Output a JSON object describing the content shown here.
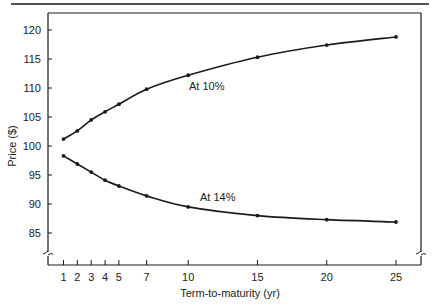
{
  "chart_data": {
    "type": "line",
    "title": "",
    "xlabel": "Term-to-maturity (yr)",
    "ylabel": "Price ($)",
    "x": [
      1,
      2,
      3,
      4,
      5,
      7,
      10,
      15,
      20,
      25
    ],
    "x_ticks": [
      1,
      2,
      3,
      4,
      5,
      7,
      10,
      15,
      20,
      25
    ],
    "y_ticks": [
      85,
      90,
      95,
      100,
      105,
      110,
      115,
      120
    ],
    "xlim": [
      0,
      27
    ],
    "ylim": [
      81.5,
      121.5
    ],
    "y_axis_break": true,
    "grid": false,
    "legend": "none",
    "series": [
      {
        "name": "At 10%",
        "values": [
          101.2,
          102.6,
          104.5,
          105.9,
          107.2,
          109.8,
          112.2,
          115.3,
          117.4,
          118.8
        ]
      },
      {
        "name": "At 14%",
        "values": [
          98.3,
          96.9,
          95.5,
          94.1,
          93.1,
          91.4,
          89.5,
          88.0,
          87.3,
          86.9
        ]
      }
    ],
    "annotations": [
      {
        "text": "At 10%",
        "series": "At 10%",
        "near_x": 10,
        "position": "below"
      },
      {
        "text": "At 14%",
        "series": "At 14%",
        "near_x": 10,
        "position": "above"
      }
    ],
    "line_color": "#1a1a1a"
  }
}
